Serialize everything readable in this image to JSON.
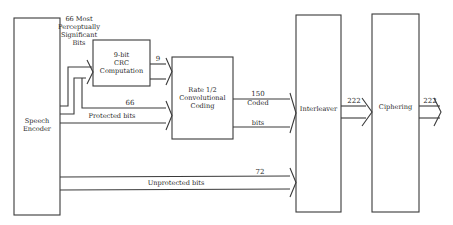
{
  "diagram": {
    "type": "block-diagram",
    "blocks": {
      "speech_encoder": {
        "line1": "Speech",
        "line2": "Encoder"
      },
      "crc": {
        "line1": "9-bit",
        "line2": "CRC",
        "line3": "Computation"
      },
      "conv": {
        "line1": "Rate 1/2",
        "line2": "Convolutional",
        "line3": "Coding"
      },
      "interleaver": {
        "label": "Interleaver"
      },
      "ciphering": {
        "label": "Ciphering"
      }
    },
    "edges": {
      "mps_label": {
        "line1": "66 Most",
        "line2": "Perceptually",
        "line3": "Significant",
        "line4": "Bits"
      },
      "crc_out": {
        "count": "9"
      },
      "protected": {
        "count": "66",
        "label": "Protected bits"
      },
      "coded": {
        "count": "150",
        "line1": "Coded",
        "line2": "bits"
      },
      "unprotected": {
        "count": "72",
        "label": "Unprotected bits"
      },
      "interleaver_out": {
        "count": "222"
      },
      "cipher_out": {
        "count": "222"
      }
    }
  }
}
